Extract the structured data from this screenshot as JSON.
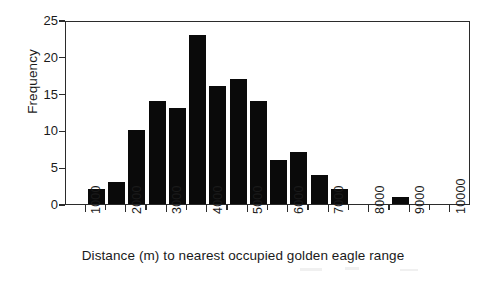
{
  "chart_data": {
    "type": "bar",
    "title": "",
    "xlabel": "Distance (m) to nearest occupied golden eagle range",
    "ylabel": "Frequency",
    "xlim": [
      500,
      10500
    ],
    "ylim": [
      0,
      25
    ],
    "bin_width": 500,
    "grid": false,
    "legend": null,
    "x_tick_labels": [
      "1000",
      "2000",
      "3000",
      "4000",
      "5000",
      "6000",
      "7000",
      "8000",
      "9000",
      "10000"
    ],
    "x_tick_values": [
      1000,
      2000,
      3000,
      4000,
      5000,
      6000,
      7000,
      8000,
      9000,
      10000
    ],
    "x_minor_tick_values": [
      1500,
      2500,
      3500,
      4500,
      5500,
      6500,
      7500,
      8500,
      9500
    ],
    "y_tick_labels": [
      "0",
      "5",
      "10",
      "15",
      "20",
      "25"
    ],
    "y_tick_values": [
      0,
      5,
      10,
      15,
      20,
      25
    ],
    "bin_starts": [
      1000,
      1500,
      2000,
      2500,
      3000,
      3500,
      4000,
      4500,
      5000,
      5500,
      6000,
      6500,
      7000,
      7500,
      8000,
      8500,
      9000,
      9500
    ],
    "values": [
      2,
      3,
      10,
      14,
      13,
      23,
      16,
      17,
      14,
      6,
      7,
      4,
      2,
      0,
      0,
      1,
      0,
      0
    ]
  },
  "axes": {
    "ylabel": "Frequency",
    "xlabel": "Distance (m) to nearest occupied golden eagle range"
  },
  "colors": {
    "bar": "#0a0a0a",
    "axis": "#2b2b2b",
    "background": "#ffffff"
  }
}
